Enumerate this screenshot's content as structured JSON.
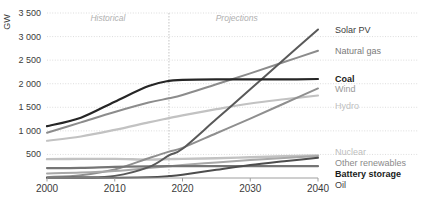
{
  "chart_data": {
    "type": "line",
    "title": "",
    "subtitle": "",
    "xlabel": "",
    "ylabel": "GW",
    "ylim": [
      0,
      3500
    ],
    "xlim": [
      2000,
      2040
    ],
    "grid": true,
    "legend_position": "right",
    "y_ticks": [
      "3 500",
      "3 000",
      "2 500",
      "2 000",
      "1 500",
      "1 000",
      "500"
    ],
    "y_tick_values": [
      3500,
      3000,
      2500,
      2000,
      1500,
      1000,
      500
    ],
    "x_ticks": [
      "2000",
      "2010",
      "2020",
      "2030",
      "2040"
    ],
    "x_tick_values": [
      2000,
      2010,
      2020,
      2030,
      2040
    ],
    "annotations": [
      {
        "text": "Historical",
        "x": 2009,
        "y": 3320
      },
      {
        "text": "Projections",
        "x": 2028,
        "y": 3320
      }
    ],
    "divider_x": 2018,
    "x": [
      2000,
      2005,
      2010,
      2015,
      2018,
      2020,
      2025,
      2030,
      2035,
      2040
    ],
    "series": [
      {
        "name": "Solar PV",
        "color": "#595959",
        "width": 2.0,
        "label_color": "#404040",
        "label_weight": "normal",
        "values": [
          5,
          15,
          45,
          230,
          480,
          620,
          1250,
          1880,
          2520,
          3150
        ]
      },
      {
        "name": "Natural gas",
        "color": "#8c8c8c",
        "width": 2.0,
        "label_color": "#7a7a7a",
        "label_weight": "normal",
        "values": [
          960,
          1180,
          1400,
          1600,
          1690,
          1760,
          1990,
          2220,
          2460,
          2700
        ]
      },
      {
        "name": "Coal",
        "color": "#262626",
        "width": 2.2,
        "label_color": "#1a1a1a",
        "label_weight": "bold",
        "values": [
          1100,
          1280,
          1620,
          1950,
          2060,
          2080,
          2090,
          2090,
          2090,
          2100
        ]
      },
      {
        "name": "Wind",
        "color": "#8f8f8f",
        "width": 2.0,
        "label_color": "#9a9a9a",
        "label_weight": "normal",
        "values": [
          18,
          60,
          180,
          420,
          560,
          640,
          950,
          1260,
          1580,
          1900
        ]
      },
      {
        "name": "Hydro",
        "color": "#c2c2c2",
        "width": 2.2,
        "label_color": "#c0c0c0",
        "label_weight": "normal",
        "values": [
          790,
          880,
          1020,
          1180,
          1270,
          1330,
          1460,
          1580,
          1670,
          1750
        ]
      },
      {
        "name": "Nuclear",
        "color": "#c2c2c2",
        "width": 2.4,
        "label_color": "#bdbdbd",
        "label_weight": "normal",
        "values": [
          400,
          405,
          405,
          390,
          400,
          405,
          420,
          440,
          460,
          480
        ]
      },
      {
        "name": "Other renewables",
        "color": "#a8a8a8",
        "width": 2.0,
        "label_color": "#8a8a8a",
        "label_weight": "normal",
        "values": [
          95,
          115,
          150,
          210,
          250,
          275,
          330,
          380,
          425,
          465
        ]
      },
      {
        "name": "Battery storage",
        "color": "#4d4d4d",
        "width": 2.0,
        "label_color": "#1a1a1a",
        "label_weight": "bold",
        "values": [
          0,
          2,
          5,
          15,
          40,
          70,
          175,
          275,
          355,
          430
        ]
      },
      {
        "name": "Oil",
        "color": "#757575",
        "width": 2.2,
        "label_color": "#404040",
        "label_weight": "normal",
        "values": [
          210,
          215,
          235,
          245,
          250,
          250,
          250,
          250,
          250,
          250
        ]
      }
    ]
  }
}
